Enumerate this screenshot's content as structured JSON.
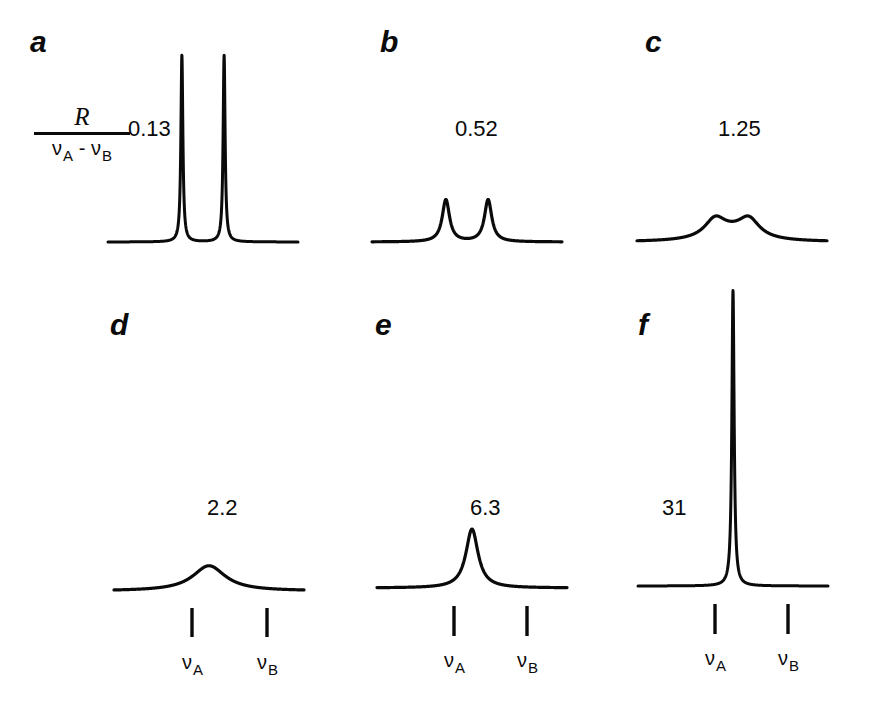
{
  "figure": {
    "background_color": "#ffffff",
    "trace_color": "#0a0a0a",
    "width": 885,
    "height": 703
  },
  "axis_label": {
    "numerator": "R",
    "denominator_a": "ν",
    "denominator_a_sub": "A",
    "denominator_operator": " - ",
    "denominator_b": "ν",
    "denominator_b_sub": "B"
  },
  "frequency_markers": {
    "nu_symbol": "ν",
    "label_a": "A",
    "label_b": "B"
  },
  "panels": [
    {
      "letter": "a",
      "ratio": "0.13",
      "ratio_value": 0.13,
      "shows_markers": false
    },
    {
      "letter": "b",
      "ratio": "0.52",
      "ratio_value": 0.52,
      "shows_markers": false
    },
    {
      "letter": "c",
      "ratio": "1.25",
      "ratio_value": 1.25,
      "shows_markers": false
    },
    {
      "letter": "d",
      "ratio": "2.2",
      "ratio_value": 2.2,
      "shows_markers": true
    },
    {
      "letter": "e",
      "ratio": "6.3",
      "ratio_value": 6.3,
      "shows_markers": true
    },
    {
      "letter": "f",
      "ratio": "31",
      "ratio_value": 31,
      "shows_markers": true
    }
  ],
  "chart_data": {
    "type": "line",
    "title": "",
    "xlabel": "",
    "ylabel": "",
    "grid": false,
    "legend": false,
    "x_axis": {
      "quantity": "frequency",
      "nu_A_position": -0.5,
      "nu_B_position": 0.5,
      "range": [
        -2.2,
        2.2
      ],
      "tick_labels": [
        "νA",
        "νB"
      ]
    },
    "series": [
      {
        "name": "a",
        "label": "0.13",
        "ratio": 0.13,
        "peaks": [
          {
            "center": -0.5,
            "relative_height": 1.0
          },
          {
            "center": 0.5,
            "relative_height": 1.0
          }
        ],
        "peak_pixel_height": 187,
        "coalesced": false,
        "resolved": true
      },
      {
        "name": "b",
        "label": "0.52",
        "ratio": 0.52,
        "peaks": [
          {
            "center": -0.5,
            "relative_height": 0.225
          },
          {
            "center": 0.5,
            "relative_height": 0.225
          }
        ],
        "peak_pixel_height": 42,
        "coalesced": false,
        "resolved": true
      },
      {
        "name": "c",
        "label": "1.25",
        "ratio": 1.25,
        "peaks": [
          {
            "center": -0.38,
            "relative_height": 0.112
          },
          {
            "center": 0.38,
            "relative_height": 0.112
          }
        ],
        "peak_pixel_height": 21,
        "coalesced": false,
        "resolved": false
      },
      {
        "name": "d",
        "label": "2.2",
        "ratio": 2.2,
        "peaks": [
          {
            "center": 0.0,
            "relative_height": 0.135
          }
        ],
        "peak_pixel_height": 25,
        "coalesced": true,
        "resolved": false
      },
      {
        "name": "e",
        "label": "6.3",
        "ratio": 6.3,
        "peaks": [
          {
            "center": 0.0,
            "relative_height": 0.315
          }
        ],
        "peak_pixel_height": 59,
        "coalesced": true,
        "resolved": false
      },
      {
        "name": "f",
        "label": "31",
        "ratio": 31,
        "peaks": [
          {
            "center": 0.0,
            "relative_height": 1.58
          }
        ],
        "peak_pixel_height": 296,
        "coalesced": true,
        "resolved": false
      }
    ]
  },
  "layout": {
    "panels_px": [
      {
        "letter": "a",
        "letter_x": 30,
        "letter_y": 27,
        "ratio_x": 128,
        "ratio_y": 118,
        "plot_x": 108,
        "plot_y": 45,
        "plot_w": 190,
        "plot_h": 200,
        "baseline_y": 242,
        "nuA_x": 186,
        "nuB_x": 262,
        "markers_y_top": 0,
        "markers_y_bottom": 0,
        "label_y": 0
      },
      {
        "letter": "b",
        "letter_x": 380,
        "letter_y": 27,
        "ratio_x": 455,
        "ratio_y": 118,
        "plot_x": 372,
        "plot_y": 45,
        "plot_w": 190,
        "plot_h": 200,
        "baseline_y": 242,
        "nuA_x": 450,
        "nuB_x": 524,
        "markers_y_top": 0,
        "markers_y_bottom": 0,
        "label_y": 0
      },
      {
        "letter": "c",
        "letter_x": 645,
        "letter_y": 27,
        "ratio_x": 718,
        "ratio_y": 118,
        "plot_x": 637,
        "plot_y": 45,
        "plot_w": 190,
        "plot_h": 200,
        "baseline_y": 242,
        "nuA_x": 715,
        "nuB_x": 789,
        "markers_y_top": 0,
        "markers_y_bottom": 0,
        "label_y": 0
      },
      {
        "letter": "d",
        "letter_x": 110,
        "letter_y": 310,
        "ratio_x": 207,
        "ratio_y": 497,
        "plot_x": 114,
        "plot_y": 290,
        "plot_w": 190,
        "plot_h": 300,
        "baseline_y": 591,
        "nuA_x": 192,
        "nuB_x": 267,
        "markers_y_top": 606,
        "markers_y_bottom": 635,
        "label_y": 652
      },
      {
        "letter": "e",
        "letter_x": 375,
        "letter_y": 310,
        "ratio_x": 470,
        "ratio_y": 497,
        "plot_x": 377,
        "plot_y": 290,
        "plot_w": 190,
        "plot_h": 300,
        "baseline_y": 588,
        "nuA_x": 454,
        "nuB_x": 527,
        "markers_y_top": 604,
        "markers_y_bottom": 634,
        "label_y": 650
      },
      {
        "letter": "f",
        "letter_x": 638,
        "letter_y": 310,
        "ratio_x": 662,
        "ratio_y": 497,
        "plot_x": 638,
        "plot_y": 285,
        "plot_w": 190,
        "plot_h": 305,
        "baseline_y": 586,
        "nuA_x": 715,
        "nuB_x": 788,
        "markers_y_top": 602,
        "markers_y_bottom": 632,
        "label_y": 648
      }
    ]
  }
}
